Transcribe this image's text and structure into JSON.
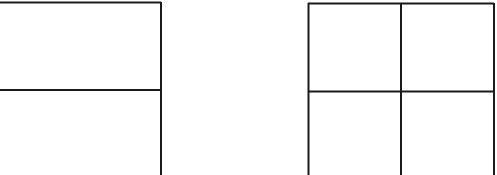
{
  "diagram": {
    "background": "#ffffff",
    "stroke_color": "#1a1a1a",
    "figures": [
      {
        "name": "left-rectangle-split-horizontally",
        "description": "Rectangle divided into two stacked parts by one horizontal line",
        "rows": 2,
        "cols": 1
      },
      {
        "name": "right-square-grid-2x2",
        "description": "Square divided into four equal cells by one horizontal and one vertical line",
        "rows": 2,
        "cols": 2
      }
    ]
  }
}
